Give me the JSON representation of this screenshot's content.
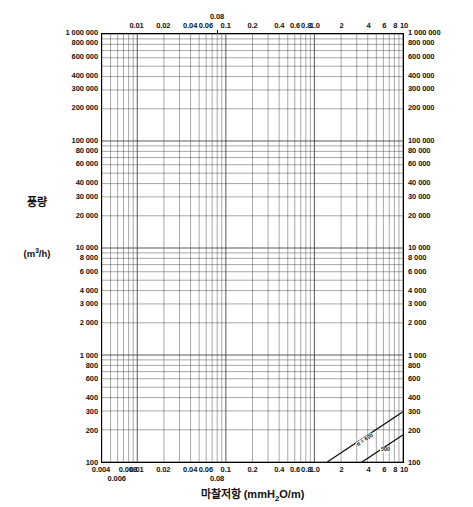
{
  "chart_data": {
    "type": "line",
    "title": "",
    "subtitle": "",
    "xlabel": "마찰저항 (mmH₂O/m)",
    "ylabel": "풍량",
    "ylabel_unit": "(m³/h)",
    "xscale": "log",
    "yscale": "log",
    "xlim": [
      0.004,
      10
    ],
    "ylim": [
      100,
      1000000
    ],
    "grid": true,
    "legend_position": "none",
    "x_ticks_bottom": [
      {
        "value": 0.004,
        "label": "0.004",
        "offset": 0
      },
      {
        "value": 0.006,
        "label": "0.006",
        "offset": 1
      },
      {
        "value": 0.008,
        "label": "0.008",
        "offset": 0
      },
      {
        "value": 0.01,
        "label": "0.01",
        "offset": 0
      },
      {
        "value": 0.02,
        "label": "0.02",
        "offset": 0
      },
      {
        "value": 0.04,
        "label": "0.04",
        "offset": 0
      },
      {
        "value": 0.06,
        "label": "0.06",
        "offset": 0
      },
      {
        "value": 0.08,
        "label": "0.08",
        "offset": 1
      },
      {
        "value": 0.1,
        "label": "0.1",
        "offset": 0
      },
      {
        "value": 0.2,
        "label": "0.2",
        "offset": 0
      },
      {
        "value": 0.4,
        "label": "0.4",
        "offset": 0
      },
      {
        "value": 0.6,
        "label": "0.6",
        "offset": 0
      },
      {
        "value": 0.8,
        "label": "0.8",
        "offset": 0
      },
      {
        "value": 1.0,
        "label": "1.0",
        "offset": 0
      },
      {
        "value": 2,
        "label": "2",
        "offset": 0
      },
      {
        "value": 4,
        "label": "4",
        "offset": 0
      },
      {
        "value": 6,
        "label": "6",
        "offset": 0
      },
      {
        "value": 8,
        "label": "8",
        "offset": 0
      },
      {
        "value": 10,
        "label": "10",
        "offset": 0
      }
    ],
    "x_ticks_top": [
      {
        "value": 0.01,
        "label": "0.01",
        "offset": 0
      },
      {
        "value": 0.02,
        "label": "0.02",
        "offset": 0
      },
      {
        "value": 0.04,
        "label": "0.04",
        "offset": 0
      },
      {
        "value": 0.06,
        "label": "0.06",
        "offset": 0
      },
      {
        "value": 0.08,
        "label": "0.08",
        "offset": 1
      },
      {
        "value": 0.1,
        "label": "0.1",
        "offset": 0
      },
      {
        "value": 0.2,
        "label": "0.2",
        "offset": 0
      },
      {
        "value": 0.4,
        "label": "0.4",
        "offset": 0
      },
      {
        "value": 0.6,
        "label": "0.6",
        "offset": 0
      },
      {
        "value": 0.8,
        "label": "0.8",
        "offset": 0
      },
      {
        "value": 1.0,
        "label": "1.0",
        "offset": 0
      },
      {
        "value": 2,
        "label": "2",
        "offset": 0
      },
      {
        "value": 4,
        "label": "4",
        "offset": 0
      },
      {
        "value": 6,
        "label": "6",
        "offset": 0
      },
      {
        "value": 8,
        "label": "8",
        "offset": 0
      },
      {
        "value": 10,
        "label": "10",
        "offset": 0
      }
    ],
    "y_ticks": [
      {
        "value": 1000000,
        "label": "1 000 000"
      },
      {
        "value": 800000,
        "label": "800 000"
      },
      {
        "value": 600000,
        "label": "600 000"
      },
      {
        "value": 400000,
        "label": "400 000"
      },
      {
        "value": 300000,
        "label": "300 000"
      },
      {
        "value": 200000,
        "label": "200 000"
      },
      {
        "value": 100000,
        "label": "100 000"
      },
      {
        "value": 80000,
        "label": "80 000"
      },
      {
        "value": 60000,
        "label": "60 000"
      },
      {
        "value": 40000,
        "label": "40 000"
      },
      {
        "value": 30000,
        "label": "30 000"
      },
      {
        "value": 20000,
        "label": "20 000"
      },
      {
        "value": 10000,
        "label": "10 000"
      },
      {
        "value": 8000,
        "label": "8 000"
      },
      {
        "value": 6000,
        "label": "6 000"
      },
      {
        "value": 4000,
        "label": "4 000"
      },
      {
        "value": 3000,
        "label": "3 000"
      },
      {
        "value": 2000,
        "label": "2 000"
      },
      {
        "value": 1000,
        "label": "1 000"
      },
      {
        "value": 800,
        "label": "800"
      },
      {
        "value": 600,
        "label": "600"
      },
      {
        "value": 400,
        "label": "400"
      },
      {
        "value": 300,
        "label": "300"
      },
      {
        "value": 200,
        "label": "200"
      },
      {
        "value": 100,
        "label": "100"
      }
    ],
    "diameter_series_name": "d",
    "diameter_unit": "mm",
    "diameter_first_label": "d = 600",
    "diameter_mid_label": "d = 250 mm",
    "diameter_small_label": "d = 25",
    "diameters": [
      {
        "label": "600",
        "value": 600
      },
      {
        "label": "500",
        "value": 500
      },
      {
        "label": "400",
        "value": 400
      },
      {
        "label": "350",
        "value": 350
      },
      {
        "label": "300",
        "value": 300
      },
      {
        "label": "250",
        "value": 250
      },
      {
        "label": "200",
        "value": 200
      },
      {
        "label": "180",
        "value": 180
      },
      {
        "label": "160",
        "value": 160
      },
      {
        "label": "140",
        "value": 140
      },
      {
        "label": "120",
        "value": 120
      },
      {
        "label": "100",
        "value": 100
      },
      {
        "label": "90",
        "value": 90
      },
      {
        "label": "80",
        "value": 80
      },
      {
        "label": "70",
        "value": 70
      },
      {
        "label": "60",
        "value": 60
      },
      {
        "label": "50",
        "value": 50
      },
      {
        "label": "45",
        "value": 45
      },
      {
        "label": "40",
        "value": 40
      },
      {
        "label": "35",
        "value": 35
      },
      {
        "label": "30",
        "value": 30
      },
      {
        "label": "25",
        "value": 25
      }
    ],
    "velocity_series_name": "v",
    "velocity_unit": "m/s",
    "velocity_label": "v = 30 m/s",
    "velocities": [
      {
        "label": "30",
        "value": 30
      },
      {
        "label": "25",
        "value": 25
      },
      {
        "label": "20",
        "value": 20
      },
      {
        "label": "15",
        "value": 15
      },
      {
        "label": "10",
        "value": 10
      },
      {
        "label": "8",
        "value": 8
      },
      {
        "label": "6",
        "value": 6
      },
      {
        "label": "5",
        "value": 5
      },
      {
        "label": "4",
        "value": 4
      },
      {
        "label": "3",
        "value": 3
      },
      {
        "label": "2",
        "value": 2
      }
    ]
  }
}
